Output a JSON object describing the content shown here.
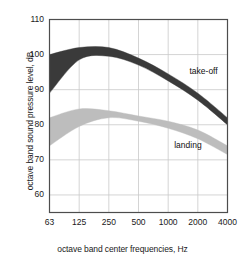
{
  "chart_data": {
    "type": "area",
    "title": "",
    "subtitle": "",
    "xlabel": "octave band center frequencies, Hz",
    "ylabel": "octave band sound pressure level, dB",
    "x_tick_labels": [
      "63",
      "125",
      "250",
      "500",
      "1000",
      "2000",
      "4000"
    ],
    "x": [
      63,
      125,
      250,
      500,
      1000,
      2000,
      4000
    ],
    "x_scale": "log-octave",
    "xlim": [
      63,
      4000
    ],
    "ylim": [
      55,
      110
    ],
    "y_tick_labels": [
      "110",
      "100",
      "90",
      "80",
      "70",
      "60"
    ],
    "y_ticks": [
      110,
      100,
      90,
      80,
      70,
      60
    ],
    "grid": true,
    "legend_position": "inline-annotation",
    "series": [
      {
        "name": "take-off",
        "color": "#3a3a3a",
        "label": "take-off",
        "label_x": 2000,
        "label_y": 95,
        "upper": [
          100,
          102,
          102,
          99,
          94.5,
          89,
          82
        ],
        "lower": [
          89,
          98.5,
          99.5,
          97,
          92.5,
          87,
          80
        ]
      },
      {
        "name": "landing",
        "color": "#bdbdbd",
        "label": "landing",
        "label_x": 1400,
        "label_y": 74,
        "upper": [
          82,
          84.5,
          84,
          82.5,
          81,
          78.5,
          74
        ],
        "lower": [
          74,
          79.5,
          82,
          81,
          79,
          76,
          71.5
        ]
      }
    ]
  },
  "annotations": {
    "takeoff_label": "take-off",
    "landing_label": "landing"
  },
  "axes": {
    "x_title": "octave band center frequencies, Hz",
    "y_title": "octave band sound pressure level, dB"
  }
}
